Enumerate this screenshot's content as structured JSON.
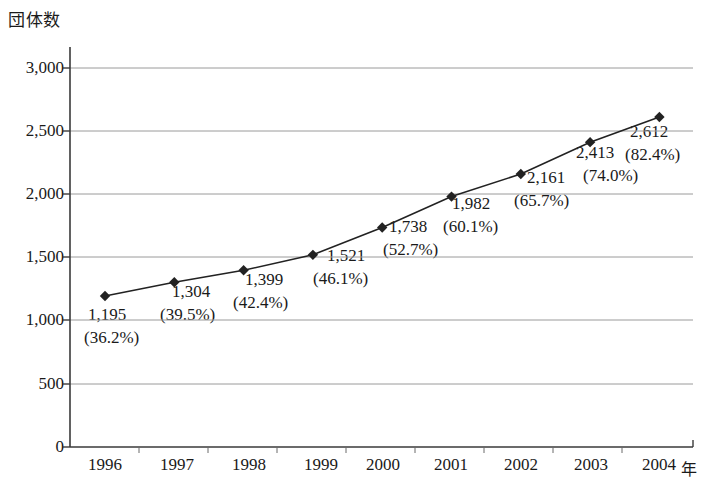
{
  "chart_data": {
    "type": "line",
    "title": "",
    "ylabel": "団体数",
    "xlabel": "",
    "x_unit_label": "年",
    "categories": [
      "1996",
      "1997",
      "1998",
      "1999",
      "2000",
      "2001",
      "2002",
      "2003",
      "2004"
    ],
    "values": [
      1195,
      1304,
      1399,
      1521,
      1738,
      1982,
      2161,
      2413,
      2612
    ],
    "value_labels": [
      "1,195",
      "1,304",
      "1,399",
      "1,521",
      "1,738",
      "1,982",
      "2,161",
      "2,413",
      "2,612"
    ],
    "percent_labels": [
      "(36.2%)",
      "(39.5%)",
      "(42.4%)",
      "(46.1%)",
      "(52.7%)",
      "(60.1%)",
      "(65.7%)",
      "(74.0%)",
      "(82.4%)"
    ],
    "percent_values": [
      36.2,
      39.5,
      42.4,
      46.1,
      52.7,
      60.1,
      65.7,
      74.0,
      82.4
    ],
    "ylim": [
      0,
      3000
    ],
    "y_ticks": [
      0,
      500,
      1000,
      1500,
      2000,
      2500,
      3000
    ],
    "y_tick_labels": [
      "0",
      "500",
      "1,000",
      "1,500",
      "2,000",
      "2,500",
      "3,000"
    ],
    "grid": true,
    "grid_axis": "y",
    "legend": "none",
    "marker": "diamond",
    "series_color": "#222222",
    "grid_color": "#9a9a9a",
    "axis_color": "#3a3a3a"
  }
}
